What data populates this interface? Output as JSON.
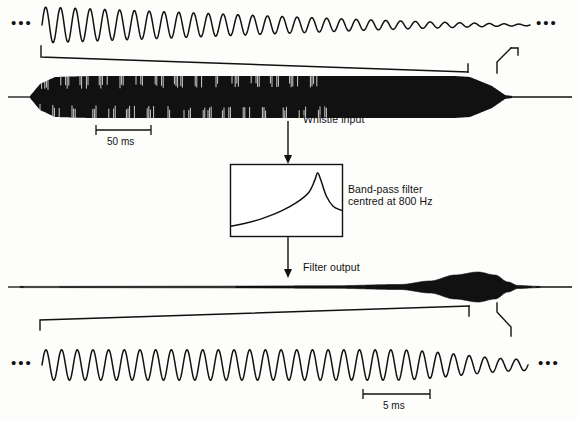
{
  "figure": {
    "ink_color": "#111111",
    "background_color": "#fdfdfb"
  },
  "labels": {
    "whistle_input": "Whistle input",
    "filter_line1": "Band-pass filter",
    "filter_line2": "centred at 800 Hz",
    "filter_output": "Filter output",
    "scale_top": "50 ms",
    "scale_bottom": "5 ms",
    "ellipsis_left_top": "•••",
    "ellipsis_right_top": "•••",
    "ellipsis_left_bottom": "•••",
    "ellipsis_right_bottom": "•••"
  },
  "chart_data": {
    "type": "line",
    "panels": [
      {
        "name": "expanded-whistle-input",
        "position": "top",
        "description": "Expanded time-domain oscillation of the whistle input, amplitude decaying toward the right",
        "xlabel": "",
        "ylabel": "",
        "scale_bar": null,
        "cycles": 33,
        "amplitude_start": 1.0,
        "amplitude_end": 0.04,
        "x_range": [
          42,
          530
        ],
        "y_center": 25,
        "y_amplitude": 18
      },
      {
        "name": "whistle-input-envelope",
        "position": "upper-middle",
        "description": "Full-duration whistle input waveform envelope, dense oscillation filled black",
        "scale_bar": {
          "label": "50 ms",
          "x_start": 96,
          "x_end": 151,
          "y": 130
        },
        "x_range": [
          30,
          512
        ],
        "y_center": 97,
        "envelope": [
          {
            "x": 30,
            "amp": 1
          },
          {
            "x": 40,
            "amp": 13
          },
          {
            "x": 55,
            "amp": 20
          },
          {
            "x": 90,
            "amp": 21
          },
          {
            "x": 150,
            "amp": 21
          },
          {
            "x": 250,
            "amp": 21
          },
          {
            "x": 380,
            "amp": 21
          },
          {
            "x": 455,
            "amp": 21
          },
          {
            "x": 470,
            "amp": 20
          },
          {
            "x": 492,
            "amp": 11
          },
          {
            "x": 505,
            "amp": 2
          },
          {
            "x": 512,
            "amp": 1
          }
        ]
      },
      {
        "name": "band-pass-filter-response",
        "position": "middle",
        "description": "Band-pass filter frequency response curve, rising gently then sharp resonant peak near 800 Hz with fast roll-off",
        "xlabel": "Frequency",
        "ylabel": "Gain",
        "box": {
          "x": 230,
          "y": 164,
          "width": 113,
          "height": 73
        },
        "peak_position_fraction": 0.78,
        "curve_points": [
          {
            "x": 0.0,
            "y": 0.08
          },
          {
            "x": 0.12,
            "y": 0.12
          },
          {
            "x": 0.28,
            "y": 0.2
          },
          {
            "x": 0.45,
            "y": 0.32
          },
          {
            "x": 0.6,
            "y": 0.47
          },
          {
            "x": 0.7,
            "y": 0.62
          },
          {
            "x": 0.755,
            "y": 0.82
          },
          {
            "x": 0.78,
            "y": 0.94
          },
          {
            "x": 0.81,
            "y": 0.82
          },
          {
            "x": 0.86,
            "y": 0.56
          },
          {
            "x": 0.92,
            "y": 0.4
          },
          {
            "x": 1.0,
            "y": 0.33
          }
        ]
      },
      {
        "name": "filter-output-envelope",
        "position": "lower-middle",
        "description": "Filter output envelope, near-silent until a single spindle-shaped burst near the end",
        "x_range": [
          20,
          540
        ],
        "y_center": 287,
        "envelope": [
          {
            "x": 20,
            "amp": 0.6
          },
          {
            "x": 200,
            "amp": 0.8
          },
          {
            "x": 330,
            "amp": 1.2
          },
          {
            "x": 400,
            "amp": 2.5
          },
          {
            "x": 430,
            "amp": 6
          },
          {
            "x": 455,
            "amp": 12
          },
          {
            "x": 478,
            "amp": 15
          },
          {
            "x": 495,
            "amp": 12
          },
          {
            "x": 508,
            "amp": 5
          },
          {
            "x": 518,
            "amp": 1.5
          },
          {
            "x": 540,
            "amp": 0.6
          }
        ]
      },
      {
        "name": "expanded-filter-output",
        "position": "bottom",
        "description": "Expanded time-domain oscillation of the filter output, near-sinusoidal at the filter centre frequency, amplitude tapering at the right",
        "scale_bar": {
          "label": "5 ms",
          "x_start": 363,
          "x_end": 430,
          "y": 397
        },
        "cycles": 31,
        "amplitude_start": 0.95,
        "amplitude_end": 0.35,
        "x_range": [
          42,
          528
        ],
        "y_center": 365,
        "y_amplitude": 16
      }
    ],
    "annotations": [
      {
        "text": "Whistle input",
        "x": 303,
        "y": 118,
        "points_to": "band-pass-filter-response"
      },
      {
        "text": "Band-pass filter",
        "x": 348,
        "y": 188,
        "points_to": "band-pass-filter-response"
      },
      {
        "text": "centred at 800 Hz",
        "x": 348,
        "y": 199,
        "points_to": "band-pass-filter-response"
      },
      {
        "text": "Filter output",
        "x": 303,
        "y": 266,
        "points_to": "filter-output-envelope"
      }
    ],
    "legend": null,
    "grid": false
  }
}
